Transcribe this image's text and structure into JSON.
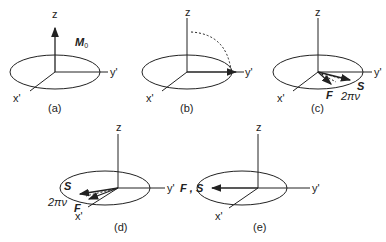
{
  "panels": [
    {
      "id": "a",
      "caption": "(a)",
      "axes": {
        "z": "z",
        "y": "y'",
        "x": "x'"
      },
      "vector_label": "M",
      "vector_sub": "0"
    },
    {
      "id": "b",
      "caption": "(b)",
      "axes": {
        "z": "z",
        "y": "y'",
        "x": "x'"
      }
    },
    {
      "id": "c",
      "caption": "(c)",
      "axes": {
        "z": "z",
        "y": "y'",
        "x": "x'"
      },
      "labels": {
        "fast": "F",
        "slow": "S",
        "angle": "2πν"
      }
    },
    {
      "id": "d",
      "caption": "(d)",
      "axes": {
        "z": "z",
        "y": "y'",
        "x": "x'"
      },
      "labels": {
        "fast": "F",
        "slow": "S",
        "angle": "2πν"
      }
    },
    {
      "id": "e",
      "caption": "(e)",
      "axes": {
        "z": "z",
        "y": "y'",
        "x": "x'"
      },
      "labels": {
        "combined": "F , S"
      }
    }
  ],
  "colors": {
    "line": "#222222",
    "background": "#ffffff"
  }
}
